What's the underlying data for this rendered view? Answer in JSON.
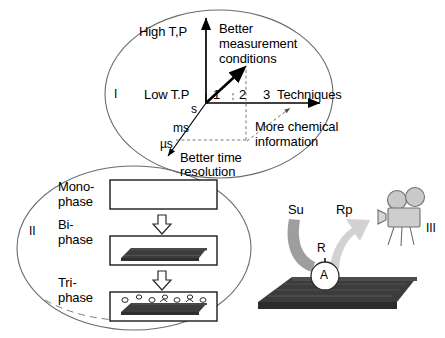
{
  "figure": {
    "background": "#ffffff",
    "ink": "#000000",
    "slab_dark": "#3a3a3a",
    "arrow_gray_dark": "#9a9a9a",
    "arrow_gray_light": "#cfcfcf",
    "camera_gray": "#c8c8c8"
  },
  "region_one": {
    "roman": "I",
    "axis_vertical": {
      "top_label": "High T,P",
      "bottom_label": "Low T.P"
    },
    "axis_horizontal": {
      "ticks": [
        "1",
        "2",
        "3"
      ],
      "label": "Techniques"
    },
    "axis_depth": {
      "ticks": [
        "s",
        "ms",
        "µs"
      ],
      "label_line1": "Better time",
      "label_line2": "resolution"
    },
    "callout_measurement": {
      "line1": "Better",
      "line2": "measurement",
      "line3": "conditions"
    },
    "callout_chemical": {
      "line1": "More chemical",
      "line2": "information"
    }
  },
  "region_two": {
    "roman": "II",
    "steps": [
      {
        "label_line1": "Mono-",
        "label_line2": "phase",
        "content": "empty"
      },
      {
        "label_line1": "Bi-",
        "label_line2": "phase",
        "content": "slab"
      },
      {
        "label_line1": "Tri-",
        "label_line2": "phase",
        "content": "slab-with-bubbles"
      }
    ],
    "transition_arrow": "down-arrow"
  },
  "region_three": {
    "roman": "III",
    "reactant_label": "Su",
    "product_label": "Rp",
    "site_label": "A",
    "intermediate_label": "R",
    "camera": "movie-camera-icon"
  }
}
